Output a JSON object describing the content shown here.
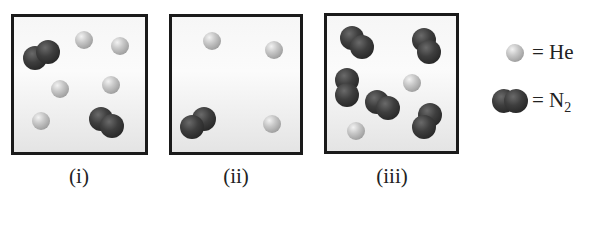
{
  "panels": [
    {
      "label": "(i)",
      "box": {
        "x": 11,
        "y": 14,
        "w": 137,
        "h": 141
      },
      "he": [
        [
          84,
          40
        ],
        [
          120,
          46
        ],
        [
          60,
          89
        ],
        [
          111,
          85
        ],
        [
          41,
          121
        ]
      ],
      "n2": [
        [
          [
            35,
            58
          ],
          [
            48,
            52
          ]
        ],
        [
          [
            101,
            119
          ],
          [
            112,
            126
          ]
        ]
      ]
    },
    {
      "label": "(ii)",
      "box": {
        "x": 169,
        "y": 14,
        "w": 134,
        "h": 141
      },
      "he": [
        [
          212,
          41
        ],
        [
          274,
          50
        ],
        [
          272,
          124
        ]
      ],
      "n2": [
        [
          [
            204,
            119
          ],
          [
            192,
            127
          ]
        ]
      ]
    },
    {
      "label": "(iii)",
      "box": {
        "x": 324,
        "y": 13,
        "w": 135,
        "h": 141
      },
      "he": [
        [
          412,
          83
        ],
        [
          356,
          131
        ]
      ],
      "n2": [
        [
          [
            352,
            38
          ],
          [
            362,
            47
          ]
        ],
        [
          [
            424,
            40
          ],
          [
            429,
            52
          ]
        ],
        [
          [
            347,
            80
          ],
          [
            347,
            95
          ]
        ],
        [
          [
            377,
            102
          ],
          [
            388,
            108
          ]
        ],
        [
          [
            430,
            115
          ],
          [
            424,
            127
          ]
        ]
      ]
    }
  ],
  "label_positions": [
    79,
    236,
    392
  ],
  "legend": {
    "he": {
      "equals": "=",
      "symbol": "He"
    },
    "n2": {
      "equals": "=",
      "symbol": "N",
      "subscript": "2"
    }
  }
}
